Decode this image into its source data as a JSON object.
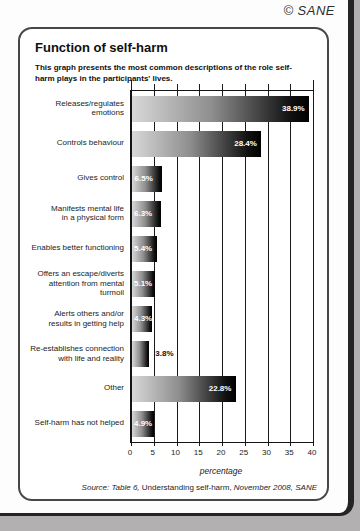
{
  "page": {
    "copyright": "© SANE",
    "panel": {
      "title": "Function of self-harm",
      "subtitle": "This graph presents the most common descriptions of the role self-harm plays in the participants' lives.",
      "source_parts": [
        {
          "text": "Source: Table 6, ",
          "italic": true
        },
        {
          "text": "Understanding self-harm, ",
          "italic": false
        },
        {
          "text": "November 2008, SANE",
          "italic": true
        }
      ]
    }
  },
  "chart_data": {
    "type": "bar",
    "orientation": "horizontal",
    "title": "Function of self-harm",
    "categories": [
      "Releases/regulates emotions",
      "Controls behaviour",
      "Gives control",
      "Manifests mental life\nin a physical form",
      "Enables better functioning",
      "Offers an escape/diverts\nattention from mental turmoil",
      "Alerts others and/or\nresults in getting help",
      "Re-establishes connection\nwith life and reality",
      "Other",
      "Self-harm has not helped"
    ],
    "values": [
      38.9,
      28.4,
      6.5,
      6.3,
      5.4,
      5.1,
      4.3,
      3.8,
      22.8,
      4.9
    ],
    "value_labels": [
      "38.9%",
      "28.4%",
      "6.5%",
      "6.3%",
      "5.4%",
      "5.1%",
      "4.3%",
      "3.8%",
      "22.8%",
      "4.9%"
    ],
    "outside_label_indices": [
      7
    ],
    "xlabel": "percentage",
    "xlim": [
      0,
      40
    ],
    "xticks": [
      0,
      5,
      10,
      15,
      20,
      25,
      30,
      35,
      40
    ],
    "grid": true,
    "legend": false,
    "bar_gradient": [
      "#d8d8d8",
      "#000000"
    ],
    "gridline_color": "#1a1a1a"
  }
}
